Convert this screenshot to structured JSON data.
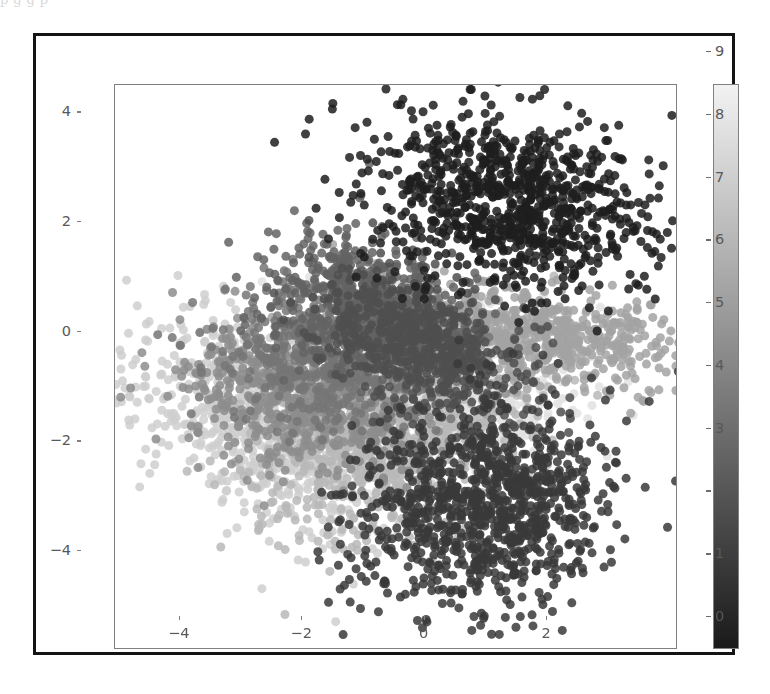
{
  "page": {
    "scan_top_text": "p              g           g                          p"
  },
  "figure": {
    "background": "#ffffff",
    "frame_color": "#141414",
    "axis_color": "#808080",
    "tick_label_color": "#58585a"
  },
  "chart_data": {
    "type": "scatter",
    "title": "",
    "xlabel": "",
    "ylabel": "",
    "xlim": [
      -5.6,
      3.6
    ],
    "ylim": [
      -5.2,
      5.1
    ],
    "xticks": [
      -4,
      -2,
      0,
      2
    ],
    "xtick_labels": [
      "−4",
      "−2",
      "0",
      "2"
    ],
    "yticks": [
      -4,
      -2,
      0,
      2,
      4
    ],
    "ytick_labels": [
      "−4",
      "−2",
      "0",
      "2",
      "4"
    ],
    "grid": false,
    "marker": "circle",
    "marker_size_px": 9,
    "marker_alpha": 0.85,
    "colormap": "Greys_r",
    "colorbar": {
      "position": "right",
      "orientation": "vertical",
      "vmin": 0,
      "vmax": 9,
      "ticks": [
        0,
        1,
        2,
        3,
        4,
        5,
        6,
        7,
        8,
        9
      ],
      "tick_labels": [
        "0",
        "1",
        "2",
        "3",
        "4",
        "5",
        "6",
        "7",
        "8",
        "9"
      ],
      "low_color": "#1a1a1a",
      "high_color": "#f2f2f2"
    },
    "legend": null,
    "series": [
      {
        "name": "0",
        "value": 0,
        "color": "#1f1f1f",
        "n": 900,
        "center": [
          0.85,
          2.95
        ],
        "spread": [
          1.2,
          0.78
        ],
        "rotation": -10
      },
      {
        "name": "1",
        "value": 1,
        "color": "#3a3a3a",
        "n": 1000,
        "center": [
          0.45,
          -2.55
        ],
        "spread": [
          1.05,
          0.92
        ],
        "rotation": 35
      },
      {
        "name": "2",
        "value": 2,
        "color": "#4f4f4f",
        "n": 620,
        "center": [
          -0.55,
          0.35
        ],
        "spread": [
          0.95,
          0.55
        ],
        "rotation": -30
      },
      {
        "name": "3",
        "value": 3,
        "color": "#636363",
        "n": 560,
        "center": [
          -1.55,
          1.05
        ],
        "spread": [
          0.85,
          0.6
        ],
        "rotation": -25
      },
      {
        "name": "4",
        "value": 4,
        "color": "#767676",
        "n": 520,
        "center": [
          -2.05,
          0.15
        ],
        "spread": [
          0.9,
          0.62
        ],
        "rotation": -15
      },
      {
        "name": "5",
        "value": 5,
        "color": "#8d8d8d",
        "n": 560,
        "center": [
          -2.55,
          -0.65
        ],
        "spread": [
          1.05,
          0.62
        ],
        "rotation": -20
      },
      {
        "name": "6",
        "value": 6,
        "color": "#a3a3a3",
        "n": 700,
        "center": [
          1.05,
          0.55
        ],
        "spread": [
          1.35,
          0.45
        ],
        "rotation": -8
      },
      {
        "name": "7",
        "value": 7,
        "color": "#b8b8b8",
        "n": 760,
        "center": [
          -1.25,
          -1.25
        ],
        "spread": [
          1.15,
          0.85
        ],
        "rotation": 20
      },
      {
        "name": "8",
        "value": 8,
        "color": "#cfcfcf",
        "n": 820,
        "center": [
          -2.95,
          -1.05
        ],
        "spread": [
          1.35,
          0.8
        ],
        "rotation": -30
      },
      {
        "name": "9",
        "value": 9,
        "color": "#e2e2e2",
        "n": 700,
        "center": [
          -0.35,
          -0.45
        ],
        "spread": [
          1.05,
          0.75
        ],
        "rotation": 10
      }
    ]
  }
}
